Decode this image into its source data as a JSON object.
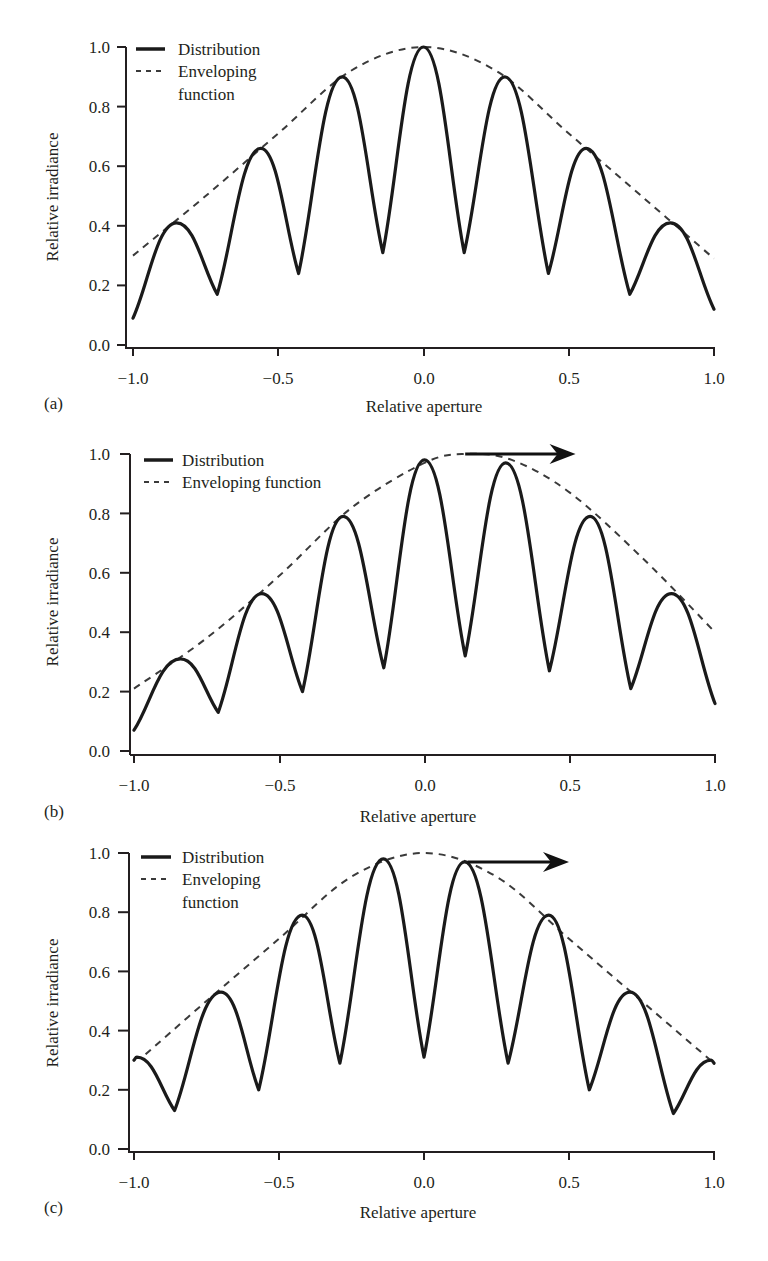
{
  "figure": {
    "panels": [
      {
        "id": "a",
        "label": "(a)",
        "xlabel": "Relative aperture",
        "ylabel": "Relative irradiance",
        "legend": {
          "distribution": "Distribution",
          "envelope_line1": "Enveloping",
          "envelope_line2": "function"
        },
        "arrow": null
      },
      {
        "id": "b",
        "label": "(b)",
        "xlabel": "Relative aperture",
        "ylabel": "Relative irradiance",
        "legend": {
          "distribution": "Distribution",
          "envelope_line1": "Enveloping function",
          "envelope_line2": ""
        },
        "arrow": {
          "x0": 0.14,
          "x1": 0.52,
          "y": 1.0
        }
      },
      {
        "id": "c",
        "label": "(c)",
        "xlabel": "Relative aperture",
        "ylabel": "Relative irradiance",
        "legend": {
          "distribution": "Distribution",
          "envelope_line1": "Enveloping",
          "envelope_line2": "function"
        },
        "arrow": {
          "x0": 0.15,
          "x1": 0.5,
          "y": 0.97
        }
      }
    ],
    "yticks": [
      "0.0",
      "0.2",
      "0.4",
      "0.6",
      "0.8",
      "1.0"
    ],
    "xticks": [
      "−1.0",
      "−0.5",
      "0.0",
      "0.5",
      "1.0"
    ]
  },
  "chart_data": [
    {
      "type": "line",
      "panel": "(a)",
      "xlabel": "Relative aperture",
      "ylabel": "Relative irradiance",
      "xlim": [
        -1.0,
        1.0
      ],
      "ylim": [
        0.0,
        1.0
      ],
      "xticks": [
        -1.0,
        -0.5,
        0.0,
        0.5,
        1.0
      ],
      "yticks": [
        0.0,
        0.2,
        0.4,
        0.6,
        0.8,
        1.0
      ],
      "legend": [
        "Distribution",
        "Enveloping function"
      ],
      "legend_position": "upper left",
      "grid": false,
      "series": [
        {
          "name": "Distribution",
          "style": "solid",
          "x": [
            -1.0,
            -0.85,
            -0.71,
            -0.56,
            -0.43,
            -0.28,
            -0.14,
            0.0,
            0.14,
            0.28,
            0.43,
            0.56,
            0.71,
            0.85,
            1.0
          ],
          "y": [
            0.09,
            0.41,
            0.17,
            0.66,
            0.24,
            0.9,
            0.31,
            1.0,
            0.31,
            0.9,
            0.24,
            0.66,
            0.17,
            0.41,
            0.12
          ],
          "minima_idx": [
            2,
            4,
            6,
            8,
            10,
            12
          ]
        },
        {
          "name": "Enveloping function",
          "style": "dashed",
          "x": [
            -1.0,
            -0.75,
            -0.5,
            -0.25,
            0.0,
            0.25,
            0.5,
            0.75,
            1.0
          ],
          "y": [
            0.3,
            0.5,
            0.71,
            0.92,
            1.0,
            0.92,
            0.71,
            0.5,
            0.29
          ]
        }
      ]
    },
    {
      "type": "line",
      "panel": "(b)",
      "xlabel": "Relative aperture",
      "ylabel": "Relative irradiance",
      "xlim": [
        -1.0,
        1.0
      ],
      "ylim": [
        0.0,
        1.0
      ],
      "xticks": [
        -1.0,
        -0.5,
        0.0,
        0.5,
        1.0
      ],
      "yticks": [
        0.0,
        0.2,
        0.4,
        0.6,
        0.8,
        1.0
      ],
      "legend": [
        "Distribution",
        "Enveloping function"
      ],
      "legend_position": "upper left",
      "grid": false,
      "annotations": [
        {
          "type": "arrow",
          "from": [
            0.14,
            1.0
          ],
          "to": [
            0.52,
            1.0
          ],
          "meaning": "envelope shift to the right"
        }
      ],
      "series": [
        {
          "name": "Distribution",
          "style": "solid",
          "x": [
            -1.0,
            -0.84,
            -0.71,
            -0.56,
            -0.42,
            -0.28,
            -0.14,
            0.0,
            0.14,
            0.28,
            0.43,
            0.57,
            0.71,
            0.85,
            1.0
          ],
          "y": [
            0.07,
            0.31,
            0.13,
            0.53,
            0.2,
            0.79,
            0.28,
            0.98,
            0.32,
            0.97,
            0.27,
            0.79,
            0.21,
            0.53,
            0.16
          ],
          "minima_idx": [
            2,
            4,
            6,
            8,
            10,
            12
          ]
        },
        {
          "name": "Enveloping function",
          "style": "dashed",
          "x": [
            -1.0,
            -0.75,
            -0.5,
            -0.25,
            0.0,
            0.14,
            0.3,
            0.5,
            0.75,
            1.0
          ],
          "y": [
            0.21,
            0.38,
            0.59,
            0.82,
            0.97,
            1.0,
            0.98,
            0.87,
            0.65,
            0.4
          ]
        }
      ]
    },
    {
      "type": "line",
      "panel": "(c)",
      "xlabel": "Relative aperture",
      "ylabel": "Relative irradiance",
      "xlim": [
        -1.0,
        1.0
      ],
      "ylim": [
        0.0,
        1.0
      ],
      "xticks": [
        -1.0,
        -0.5,
        0.0,
        0.5,
        1.0
      ],
      "yticks": [
        0.0,
        0.2,
        0.4,
        0.6,
        0.8,
        1.0
      ],
      "legend": [
        "Distribution",
        "Enveloping function"
      ],
      "legend_position": "upper left",
      "grid": false,
      "annotations": [
        {
          "type": "arrow",
          "from": [
            0.15,
            0.97
          ],
          "to": [
            0.5,
            0.97
          ],
          "meaning": "distribution shift to the right"
        }
      ],
      "series": [
        {
          "name": "Distribution",
          "style": "solid",
          "x": [
            -1.0,
            -0.99,
            -0.86,
            -0.7,
            -0.57,
            -0.42,
            -0.29,
            -0.14,
            0.0,
            0.14,
            0.29,
            0.43,
            0.57,
            0.71,
            0.86,
            0.99,
            1.0
          ],
          "y": [
            0.3,
            0.31,
            0.13,
            0.53,
            0.2,
            0.79,
            0.29,
            0.98,
            0.31,
            0.97,
            0.29,
            0.79,
            0.2,
            0.53,
            0.12,
            0.3,
            0.29
          ],
          "minima_idx": [
            2,
            4,
            6,
            8,
            10,
            12,
            14
          ]
        },
        {
          "name": "Enveloping function",
          "style": "dashed",
          "x": [
            -0.96,
            -0.75,
            -0.5,
            -0.25,
            0.0,
            0.25,
            0.5,
            0.75,
            1.0
          ],
          "y": [
            0.32,
            0.5,
            0.71,
            0.92,
            1.0,
            0.92,
            0.71,
            0.5,
            0.29
          ]
        }
      ]
    }
  ]
}
